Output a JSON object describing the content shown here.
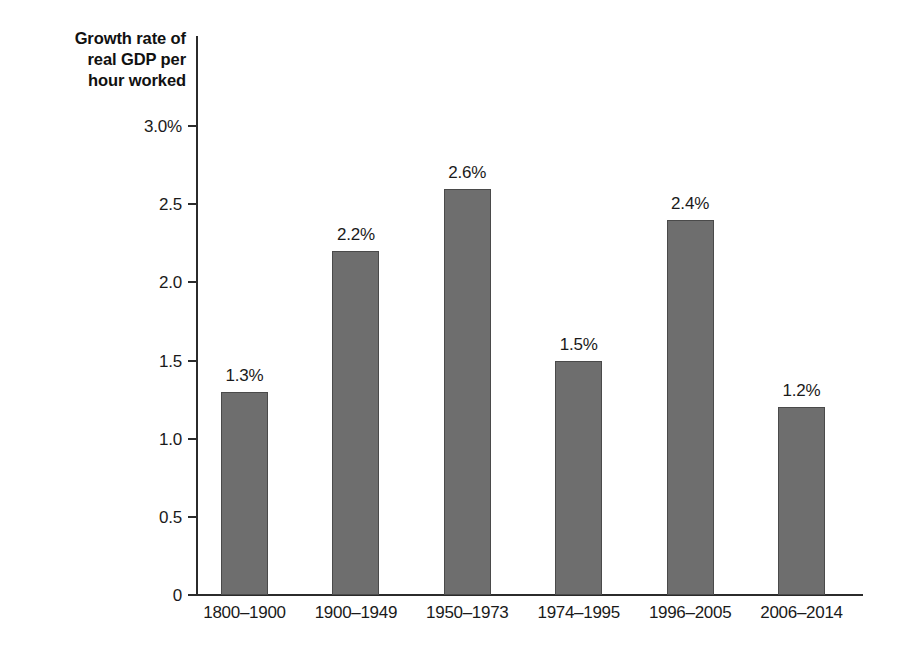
{
  "chart_data": {
    "type": "bar",
    "title": "",
    "subtitle": "",
    "xlabel": "",
    "ylabel": "Growth rate of real GDP per hour worked",
    "ylabel_lines": [
      "Growth rate of",
      "real GDP per",
      "hour worked"
    ],
    "categories": [
      "1800–1900",
      "1900–1949",
      "1950–1973",
      "1974–1995",
      "1996–2005",
      "2006–2014"
    ],
    "values": [
      1.3,
      2.2,
      2.6,
      1.5,
      2.4,
      1.2
    ],
    "value_labels": [
      "1.3%",
      "2.2%",
      "2.6%",
      "1.5%",
      "2.4%",
      "1.2%"
    ],
    "ylim": [
      0,
      3.0
    ],
    "yticks": [
      0,
      0.5,
      1.0,
      1.5,
      2.0,
      2.5,
      3.0
    ],
    "ytick_labels": [
      "0",
      "0.5",
      "1.0",
      "1.5",
      "2.0",
      "2.5",
      "3.0%"
    ],
    "grid": false,
    "legend": null,
    "legend_position": "none",
    "units": "percent",
    "bar_color": "#6e6e6e",
    "bar_edge_color": "#4a4a4a",
    "axis_color": "#2b2b2b",
    "text_color": "#1a1a1a",
    "background_color": "#ffffff"
  }
}
